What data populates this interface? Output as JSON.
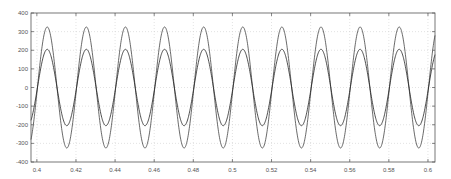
{
  "chart_data": {
    "type": "line",
    "title": "",
    "xlabel": "",
    "ylabel": "",
    "xlim": [
      0.397,
      0.6036
    ],
    "ylim": [
      -400,
      400
    ],
    "grid": true,
    "legend": null,
    "x_ticks": [
      0.4,
      0.42,
      0.44,
      0.46,
      0.48,
      0.5,
      0.52,
      0.54,
      0.56,
      0.58,
      0.6
    ],
    "x_tick_labels": [
      "0.4",
      "0.42",
      "0.44",
      "0.46",
      "0.48",
      "0.5",
      "0.52",
      "0.54",
      "0.56",
      "0.58",
      "0.6"
    ],
    "y_ticks": [
      400,
      300,
      200,
      100,
      0,
      -100,
      -200,
      -300,
      -400
    ],
    "y_tick_labels": [
      "400",
      "300",
      "200",
      "100",
      "0",
      "-100",
      "-200",
      "-300",
      "-400"
    ],
    "series": [
      {
        "name": "outer sinusoid",
        "kind": "sine",
        "amplitude": 325,
        "frequency_hz": 50,
        "peak_time": 0.4053,
        "color": "#444444"
      },
      {
        "name": "inner sinusoid",
        "kind": "sine",
        "amplitude": 205,
        "frequency_hz": 50,
        "peak_time": 0.4053,
        "color": "#222222"
      }
    ]
  },
  "colors": {
    "axes": "#555555",
    "grid": "#d0d0d0",
    "background": "#ffffff"
  }
}
